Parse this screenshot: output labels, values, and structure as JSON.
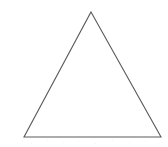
{
  "figure": {
    "name": "triangle",
    "shape_label": "triangle",
    "background_color": "#ffffff",
    "stroke_color": "#5a5a5a",
    "stroke_width": 1.1,
    "fill": "none",
    "canvas": {
      "width": 168,
      "height": 147
    },
    "vertices": [
      {
        "name": "apex",
        "x": 91,
        "y": 12
      },
      {
        "name": "bottom-right",
        "x": 161,
        "y": 137
      },
      {
        "name": "bottom-left",
        "x": 24,
        "y": 137
      }
    ],
    "polygon_points": "91,12 161,137 24,137",
    "edges": [
      {
        "name": "left-edge",
        "from": "apex",
        "to": "bottom-left"
      },
      {
        "name": "right-edge",
        "from": "apex",
        "to": "bottom-right"
      },
      {
        "name": "base-edge",
        "from": "bottom-left",
        "to": "bottom-right"
      }
    ],
    "artifacts": {
      "speckle_color": "#f2f2f2",
      "speckles": [
        {
          "x": 22,
          "y": 141
        },
        {
          "x": 31,
          "y": 143
        },
        {
          "x": 47,
          "y": 140
        },
        {
          "x": 63,
          "y": 142
        },
        {
          "x": 78,
          "y": 141
        },
        {
          "x": 95,
          "y": 143
        },
        {
          "x": 112,
          "y": 140
        },
        {
          "x": 129,
          "y": 142
        },
        {
          "x": 145,
          "y": 141
        },
        {
          "x": 158,
          "y": 143
        }
      ]
    }
  }
}
